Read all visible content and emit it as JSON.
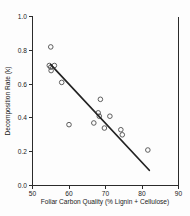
{
  "chart_data": {
    "type": "scatter",
    "title": "",
    "xlabel": "Foliar Carbon Quality (% Lignin + Cellulose)",
    "ylabel": "Decomposition Rate (k)",
    "xlim": [
      50,
      90
    ],
    "ylim": [
      0.0,
      1.0
    ],
    "xticks": [
      "50",
      "60",
      "70",
      "80",
      "90"
    ],
    "xtick_values": [
      50,
      60,
      70,
      80,
      90
    ],
    "yticks": [
      "0.0",
      "0.2",
      "0.4",
      "0.6",
      "0.8",
      "1.0"
    ],
    "ytick_values": [
      0.0,
      0.2,
      0.4,
      0.6,
      0.8,
      1.0
    ],
    "grid": false,
    "legend": "none",
    "marker_style": "open-circle",
    "points": [
      {
        "x": 55.0,
        "y": 0.82
      },
      {
        "x": 54.6,
        "y": 0.71
      },
      {
        "x": 55.0,
        "y": 0.7
      },
      {
        "x": 55.1,
        "y": 0.68
      },
      {
        "x": 56.0,
        "y": 0.71
      },
      {
        "x": 58.0,
        "y": 0.61
      },
      {
        "x": 60.0,
        "y": 0.36
      },
      {
        "x": 66.8,
        "y": 0.37
      },
      {
        "x": 68.0,
        "y": 0.43
      },
      {
        "x": 68.3,
        "y": 0.41
      },
      {
        "x": 68.6,
        "y": 0.51
      },
      {
        "x": 69.7,
        "y": 0.34
      },
      {
        "x": 71.2,
        "y": 0.41
      },
      {
        "x": 74.2,
        "y": 0.33
      },
      {
        "x": 74.6,
        "y": 0.3
      },
      {
        "x": 81.6,
        "y": 0.21
      }
    ],
    "fit_line": {
      "type": "linear-regression",
      "x_start": 55.0,
      "y_start": 0.715,
      "x_end": 82.0,
      "y_end": 0.09
    }
  },
  "axes": {
    "x_axis_name": "Foliar Carbon Quality (% Lignin + Cellulose)",
    "y_axis_name": "Decomposition Rate (k)"
  }
}
